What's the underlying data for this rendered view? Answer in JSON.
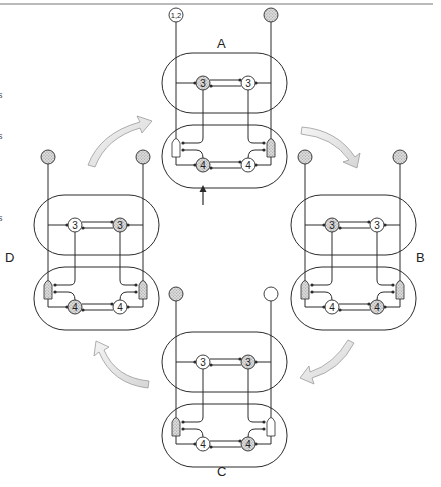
{
  "figure": {
    "type": "cycle-diagram",
    "panels": [
      {
        "id": "A",
        "label": "A",
        "offset": [
          0,
          0
        ],
        "label_pos": [
          217,
          36
        ],
        "top_pins": [
          {
            "fill": "white",
            "text": "1,2"
          },
          {
            "fill": "stippled",
            "text": ""
          }
        ],
        "upper_module": {
          "circles": [
            {
              "label": "3",
              "fill": "stippled"
            },
            {
              "label": "3",
              "fill": "white"
            }
          ]
        },
        "lower_module": {
          "circles": [
            {
              "label": "4",
              "fill": "stippled"
            },
            {
              "label": "4",
              "fill": "white"
            }
          ],
          "side_tags": [
            {
              "fill": "white"
            },
            {
              "fill": "stippled"
            }
          ]
        },
        "input_arrow": true
      },
      {
        "id": "B",
        "label": "B",
        "offset": [
          129,
          142
        ],
        "label_pos": [
          416,
          250
        ],
        "top_pins": [
          {
            "fill": "stippled",
            "text": ""
          },
          {
            "fill": "stippled",
            "text": ""
          }
        ],
        "upper_module": {
          "circles": [
            {
              "label": "3",
              "fill": "stippled"
            },
            {
              "label": "3",
              "fill": "white"
            }
          ]
        },
        "lower_module": {
          "circles": [
            {
              "label": "4",
              "fill": "white"
            },
            {
              "label": "4",
              "fill": "stippled"
            }
          ],
          "side_tags": [
            {
              "fill": "stippled"
            },
            {
              "fill": "stippled"
            }
          ]
        },
        "input_arrow": false
      },
      {
        "id": "C",
        "label": "C",
        "offset": [
          0,
          279
        ],
        "label_pos": [
          217,
          464
        ],
        "top_pins": [
          {
            "fill": "stippled",
            "text": ""
          },
          {
            "fill": "white",
            "text": ""
          }
        ],
        "upper_module": {
          "circles": [
            {
              "label": "3",
              "fill": "white"
            },
            {
              "label": "3",
              "fill": "stippled"
            }
          ]
        },
        "lower_module": {
          "circles": [
            {
              "label": "4",
              "fill": "white"
            },
            {
              "label": "4",
              "fill": "stippled"
            }
          ],
          "side_tags": [
            {
              "fill": "stippled"
            },
            {
              "fill": "white"
            }
          ]
        },
        "input_arrow": false
      },
      {
        "id": "D",
        "label": "D",
        "offset": [
          -128,
          142
        ],
        "label_pos": [
          5,
          250
        ],
        "top_pins": [
          {
            "fill": "stippled",
            "text": ""
          },
          {
            "fill": "stippled",
            "text": ""
          }
        ],
        "upper_module": {
          "circles": [
            {
              "label": "3",
              "fill": "white"
            },
            {
              "label": "3",
              "fill": "stippled"
            }
          ]
        },
        "lower_module": {
          "circles": [
            {
              "label": "4",
              "fill": "stippled"
            },
            {
              "label": "4",
              "fill": "white"
            }
          ],
          "side_tags": [
            {
              "fill": "stippled"
            },
            {
              "fill": "stippled"
            }
          ]
        },
        "input_arrow": false
      }
    ],
    "cycle_arrows": [
      {
        "from": "D",
        "to": "A",
        "direction": "up-right"
      },
      {
        "from": "A",
        "to": "B",
        "direction": "down-right"
      },
      {
        "from": "B",
        "to": "C",
        "direction": "down-left"
      },
      {
        "from": "C",
        "to": "D",
        "direction": "up-left"
      }
    ],
    "edge_text_fragments": [
      {
        "text": "s",
        "y": 90
      },
      {
        "text": "s",
        "y": 131
      },
      {
        "text": "s",
        "y": 213
      }
    ],
    "colors": {
      "line": "#2a2a2a",
      "stipple": "#c8c8c8",
      "arrow_fill": "#e6e6e6",
      "arrow_stroke": "#9a9a9a",
      "top_rule": "#777777"
    }
  }
}
